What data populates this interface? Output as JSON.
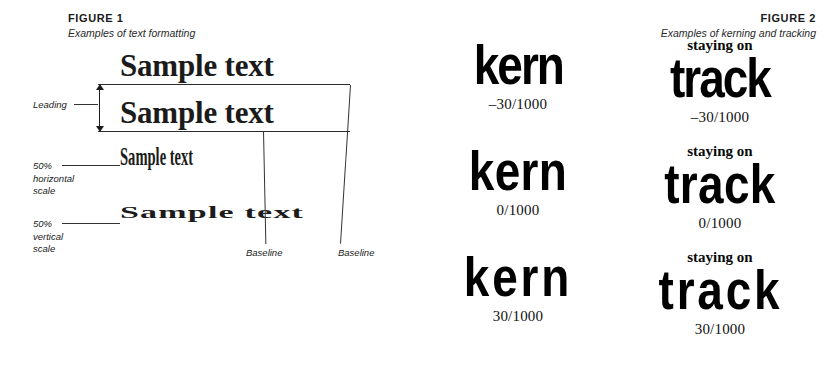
{
  "figure1": {
    "title": "FIGURE 1",
    "subtitle": "Examples of text formatting",
    "samples": [
      {
        "text": "Sample text",
        "style": "normal"
      },
      {
        "text": "Sample text",
        "style": "normal"
      },
      {
        "text": "Sample text",
        "style": "50% horizontal scale"
      },
      {
        "text": "Sample text",
        "style": "50% vertical scale"
      }
    ],
    "annotations": {
      "leading": "Leading",
      "horizontal_scale": "50%\nhorizontal\nscale",
      "horizontal_scale_line1": "50%",
      "horizontal_scale_line2": "horizontal",
      "horizontal_scale_line3": "scale",
      "vertical_scale_line1": "50%",
      "vertical_scale_line2": "vertical",
      "vertical_scale_line3": "scale",
      "baseline_1": "Baseline",
      "baseline_2": "Baseline"
    }
  },
  "figure2": {
    "title": "FIGURE 2",
    "subtitle": "Examples of kerning and tracking",
    "columns": [
      "kern",
      "track"
    ],
    "rows": [
      {
        "tracking": "-30",
        "cells": [
          {
            "word": "kern",
            "over": "",
            "caption": "–30/1000"
          },
          {
            "word": "track",
            "over": "staying on",
            "caption": "–30/1000"
          }
        ]
      },
      {
        "tracking": "0",
        "cells": [
          {
            "word": "kern",
            "over": "",
            "caption": "0/1000"
          },
          {
            "word": "track",
            "over": "staying on",
            "caption": "0/1000"
          }
        ]
      },
      {
        "tracking": "30",
        "cells": [
          {
            "word": "kern",
            "over": "",
            "caption": "30/1000"
          },
          {
            "word": "track",
            "over": "staying on",
            "caption": "30/1000"
          }
        ]
      }
    ]
  },
  "colors": {
    "background": "#ffffff",
    "ink": "#1b1b1b",
    "rule": "#2b2b2b",
    "display_ink": "#000000"
  }
}
